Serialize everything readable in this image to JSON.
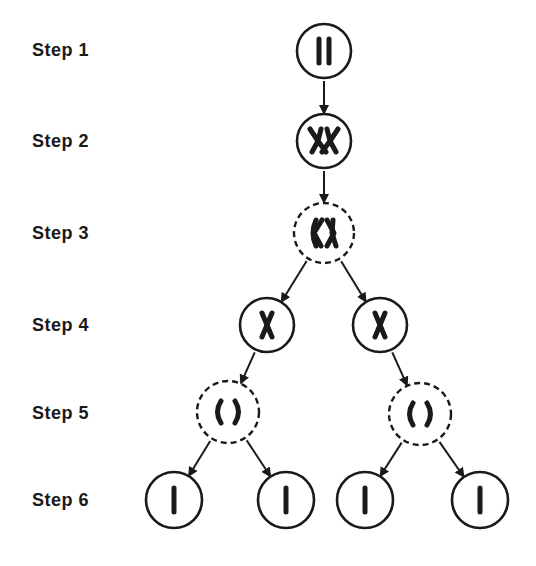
{
  "steps": [
    {
      "label": "Step 1",
      "y": 50
    },
    {
      "label": "Step 2",
      "y": 141
    },
    {
      "label": "Step 3",
      "y": 233
    },
    {
      "label": "Step 4",
      "y": 325
    },
    {
      "label": "Step 5",
      "y": 413
    },
    {
      "label": "Step 6",
      "y": 500
    }
  ],
  "cells": [
    {
      "id": "s1",
      "step": 1,
      "cx": 324,
      "cy": 51,
      "r": 27,
      "membrane": "solid",
      "contents": "two-parallel-chromosomes"
    },
    {
      "id": "s2",
      "step": 2,
      "cx": 324,
      "cy": 141,
      "r": 27,
      "membrane": "solid",
      "contents": "crossing-over-tetrad"
    },
    {
      "id": "s3",
      "step": 3,
      "cx": 324,
      "cy": 233,
      "r": 30,
      "membrane": "dashed",
      "contents": "two-separating-chromosomes"
    },
    {
      "id": "s4l",
      "step": 4,
      "cx": 267,
      "cy": 325,
      "r": 27,
      "membrane": "solid",
      "contents": "single-x-chromosome"
    },
    {
      "id": "s4r",
      "step": 4,
      "cx": 380,
      "cy": 325,
      "r": 27,
      "membrane": "solid",
      "contents": "single-x-chromosome"
    },
    {
      "id": "s5l",
      "step": 5,
      "cx": 228,
      "cy": 412,
      "r": 31,
      "membrane": "dashed",
      "contents": "separating-chromatids"
    },
    {
      "id": "s5r",
      "step": 5,
      "cx": 420,
      "cy": 414,
      "r": 31,
      "membrane": "dashed",
      "contents": "separating-chromatids"
    },
    {
      "id": "s6a",
      "step": 6,
      "cx": 174,
      "cy": 500,
      "r": 28,
      "membrane": "solid",
      "contents": "single-chromatid"
    },
    {
      "id": "s6b",
      "step": 6,
      "cx": 286,
      "cy": 500,
      "r": 28,
      "membrane": "solid",
      "contents": "single-chromatid"
    },
    {
      "id": "s6c",
      "step": 6,
      "cx": 365,
      "cy": 500,
      "r": 28,
      "membrane": "solid",
      "contents": "single-chromatid"
    },
    {
      "id": "s6d",
      "step": 6,
      "cx": 480,
      "cy": 500,
      "r": 28,
      "membrane": "solid",
      "contents": "single-chromatid"
    }
  ],
  "arrows": [
    {
      "from": "s1",
      "to": "s2"
    },
    {
      "from": "s2",
      "to": "s3"
    },
    {
      "from": "s3",
      "to": "s4l"
    },
    {
      "from": "s3",
      "to": "s4r"
    },
    {
      "from": "s4l",
      "to": "s5l"
    },
    {
      "from": "s4r",
      "to": "s5r"
    },
    {
      "from": "s5l",
      "to": "s6a"
    },
    {
      "from": "s5l",
      "to": "s6b"
    },
    {
      "from": "s5r",
      "to": "s6c"
    },
    {
      "from": "s5r",
      "to": "s6d"
    }
  ],
  "colors": {
    "ink": "#1a1a1a",
    "background": "#ffffff"
  }
}
